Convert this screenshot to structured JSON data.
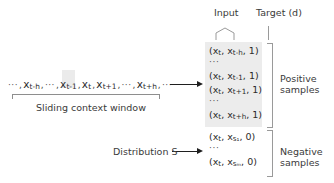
{
  "figure": {
    "colors": {
      "text": "#2b2b2b",
      "rule": "#9a9a9a",
      "arrow": "#1f1f1f",
      "shade": "#ececec",
      "highlight": "#e8e8e8"
    }
  },
  "headers": {
    "input": "Input",
    "target": "Target (d)"
  },
  "sequence": {
    "leading_dots": "···",
    "trailing_dots": "···",
    "inner_dots": "···",
    "separator": ",",
    "tokens": [
      {
        "base": "x",
        "sub": "t-h"
      },
      {
        "base": "x",
        "sub": "t-1"
      },
      {
        "base": "x",
        "sub": "t"
      },
      {
        "base": "x",
        "sub": "t+1"
      },
      {
        "base": "x",
        "sub": "t+h"
      }
    ],
    "caption": "Sliding context window"
  },
  "distribution": {
    "label": "Distribution S"
  },
  "positive": {
    "caption_line1": "Positive",
    "caption_line2": "samples",
    "rows": [
      {
        "type": "pair",
        "input_base": "x",
        "input_sub": "t",
        "target_base": "x",
        "target_sub": "t-h",
        "d": "1"
      },
      {
        "type": "ellipsis",
        "text": "···"
      },
      {
        "type": "pair",
        "input_base": "x",
        "input_sub": "t",
        "target_base": "x",
        "target_sub": "t-1",
        "d": "1"
      },
      {
        "type": "pair",
        "input_base": "x",
        "input_sub": "t",
        "target_base": "x",
        "target_sub": "t+1",
        "d": "1"
      },
      {
        "type": "ellipsis",
        "text": "···"
      },
      {
        "type": "pair",
        "input_base": "x",
        "input_sub": "t",
        "target_base": "x",
        "target_sub": "t+h",
        "d": "1"
      }
    ]
  },
  "negative": {
    "caption_line1": "Negative",
    "caption_line2": "samples",
    "rows": [
      {
        "type": "pair",
        "input_base": "x",
        "input_sub": "t",
        "target_base": "x",
        "target_sub": "s1",
        "d": "0"
      },
      {
        "type": "ellipsis",
        "text": "···"
      },
      {
        "type": "pair",
        "input_base": "x",
        "input_sub": "t",
        "target_base": "x",
        "target_sub": "sm",
        "d": "0"
      }
    ]
  },
  "subscript_text": {
    "s1": "s₁",
    "sm": "sₘ"
  }
}
